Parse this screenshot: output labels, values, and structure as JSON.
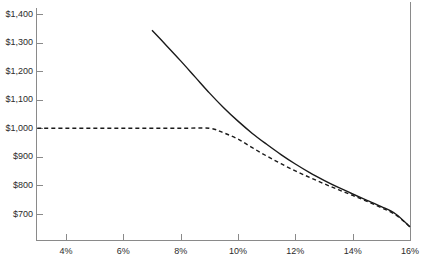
{
  "chart_data": {
    "type": "line",
    "title": "",
    "subtitle": "",
    "xlabel": "",
    "ylabel": "",
    "xlim": [
      3.0,
      16.0
    ],
    "ylim": [
      640,
      1440
    ],
    "grid": false,
    "legend": "none",
    "x_ticks": [
      {
        "value": 4,
        "label": "4%"
      },
      {
        "value": 6,
        "label": "6%"
      },
      {
        "value": 8,
        "label": "8%"
      },
      {
        "value": 10,
        "label": "10%"
      },
      {
        "value": 12,
        "label": "12%"
      },
      {
        "value": 14,
        "label": "14%"
      },
      {
        "value": 16,
        "label": "16%"
      }
    ],
    "y_ticks": [
      {
        "value": 1400,
        "label": "$1,400"
      },
      {
        "value": 1300,
        "label": "$1,300"
      },
      {
        "value": 1200,
        "label": "$1,200"
      },
      {
        "value": 1100,
        "label": "$1,100"
      },
      {
        "value": 1000,
        "label": "$1,000"
      },
      {
        "value": 900,
        "label": "$900"
      },
      {
        "value": 800,
        "label": "$800"
      },
      {
        "value": 700,
        "label": "$700"
      }
    ],
    "series": [
      {
        "name": "solid-curve",
        "style": "solid",
        "color": "#1a1a1a",
        "x": [
          7.0,
          7.5,
          8.0,
          8.5,
          9.0,
          9.5,
          10.0,
          10.5,
          11.0,
          11.5,
          12.0,
          12.5,
          13.0,
          13.5,
          14.0,
          14.5,
          15.0,
          15.5,
          16.0
        ],
        "values": [
          1343,
          1290,
          1236,
          1180,
          1124,
          1072,
          1025,
          982,
          944,
          908,
          875,
          845,
          818,
          793,
          770,
          748,
          726,
          700,
          655
        ]
      },
      {
        "name": "dashed-curve",
        "style": "dashed",
        "color": "#1a1a1a",
        "x": [
          3.0,
          4.0,
          5.0,
          6.0,
          7.0,
          8.0,
          9.0,
          9.5,
          10.0,
          10.5,
          11.0,
          11.5,
          12.0,
          12.5,
          13.0,
          13.5,
          14.0,
          14.5,
          15.0,
          15.5,
          16.0
        ],
        "values": [
          1000,
          1000,
          1000,
          1000,
          1000,
          1000,
          1000,
          984,
          962,
          932,
          903,
          876,
          851,
          828,
          806,
          785,
          765,
          744,
          722,
          697,
          655
        ]
      }
    ]
  }
}
